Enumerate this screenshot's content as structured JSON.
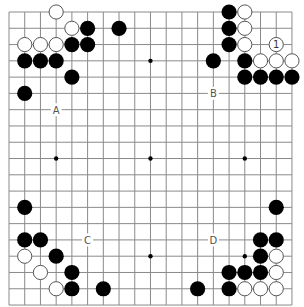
{
  "board": {
    "size": 19,
    "origin_x": 9,
    "origin_y": 12,
    "spacing_x": 15.72,
    "spacing_y": 16.28,
    "stone_radius": 7.6,
    "colors": {
      "background": "#ffffff",
      "line": "#8a8a8a",
      "black_stone": "#000000",
      "white_stone_fill": "#ffffff",
      "white_stone_stroke": "#555555",
      "star_point": "#000000",
      "label": "#555555"
    },
    "star_points": [
      [
        3,
        3
      ],
      [
        9,
        3
      ],
      [
        15,
        3
      ],
      [
        3,
        9
      ],
      [
        9,
        9
      ],
      [
        15,
        9
      ],
      [
        3,
        15
      ],
      [
        9,
        15
      ],
      [
        15,
        15
      ]
    ],
    "stones": {
      "black": [
        [
          5,
          1
        ],
        [
          7,
          1
        ],
        [
          4,
          2
        ],
        [
          5,
          2
        ],
        [
          1,
          3
        ],
        [
          2,
          3
        ],
        [
          3,
          3
        ],
        [
          4,
          4
        ],
        [
          1,
          5
        ],
        [
          14,
          0
        ],
        [
          14,
          1
        ],
        [
          14,
          2
        ],
        [
          13,
          3
        ],
        [
          15,
          3
        ],
        [
          15,
          4
        ],
        [
          16,
          4
        ],
        [
          17,
          4
        ],
        [
          18,
          4
        ],
        [
          1,
          12
        ],
        [
          1,
          14
        ],
        [
          2,
          14
        ],
        [
          3,
          15
        ],
        [
          4,
          16
        ],
        [
          4,
          17
        ],
        [
          6,
          17
        ],
        [
          17,
          12
        ],
        [
          16,
          14
        ],
        [
          17,
          14
        ],
        [
          16,
          15
        ],
        [
          14,
          16
        ],
        [
          15,
          16
        ],
        [
          16,
          16
        ],
        [
          12,
          17
        ],
        [
          14,
          17
        ]
      ],
      "white": [
        [
          3,
          0
        ],
        [
          4,
          1
        ],
        [
          1,
          2
        ],
        [
          2,
          2
        ],
        [
          3,
          2
        ],
        [
          15,
          0
        ],
        [
          15,
          1
        ],
        [
          15,
          2
        ],
        [
          16,
          3
        ],
        [
          17,
          3
        ],
        [
          18,
          3
        ],
        [
          1,
          15
        ],
        [
          2,
          16
        ],
        [
          3,
          17
        ],
        [
          17,
          15
        ],
        [
          17,
          16
        ],
        [
          15,
          17
        ],
        [
          16,
          17
        ],
        [
          17,
          17
        ]
      ]
    },
    "numbered_stones": [
      {
        "col": 17,
        "row": 2,
        "color": "white",
        "number": "1"
      }
    ],
    "labels": [
      {
        "col": 3,
        "row": 6,
        "text": "A"
      },
      {
        "col": 13,
        "row": 5,
        "text": "B"
      },
      {
        "col": 5,
        "row": 14,
        "text": "C"
      },
      {
        "col": 13,
        "row": 14,
        "text": "D"
      }
    ]
  }
}
